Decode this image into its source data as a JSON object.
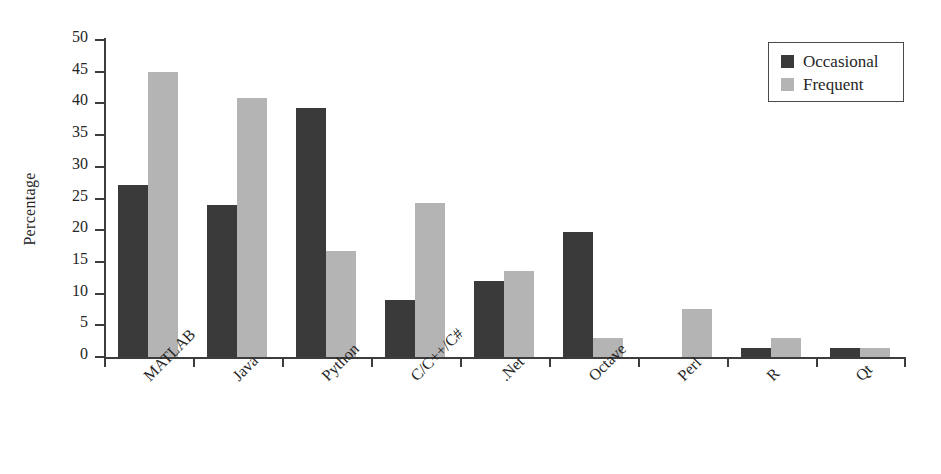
{
  "chart_data": {
    "type": "bar",
    "title": "",
    "xlabel": "",
    "ylabel": "Percentage",
    "ylim": [
      0,
      50
    ],
    "ytick_step": 5,
    "yticks": [
      0,
      5,
      10,
      15,
      20,
      25,
      30,
      35,
      40,
      45,
      50
    ],
    "grid": false,
    "legend_position": "top-right",
    "categories": [
      "MATLAB",
      "Java",
      "Python",
      "C/C++/C#",
      ".Net",
      "Octave",
      "Perl",
      "R",
      "Qt"
    ],
    "series": [
      {
        "name": "Occasional",
        "color": "#3a3a3a",
        "values": [
          27.2,
          24.0,
          39.3,
          9.0,
          12.0,
          19.7,
          0.0,
          1.5,
          1.5
        ]
      },
      {
        "name": "Frequent",
        "color": "#b4b4b4",
        "values": [
          45.0,
          40.8,
          16.7,
          24.3,
          13.6,
          3.0,
          7.5,
          3.0,
          1.5
        ]
      }
    ]
  },
  "legend": {
    "items": [
      {
        "label": "Occasional",
        "swatch": "occ"
      },
      {
        "label": "Frequent",
        "swatch": "freq"
      }
    ]
  },
  "axes": {
    "y_label": "Percentage"
  }
}
